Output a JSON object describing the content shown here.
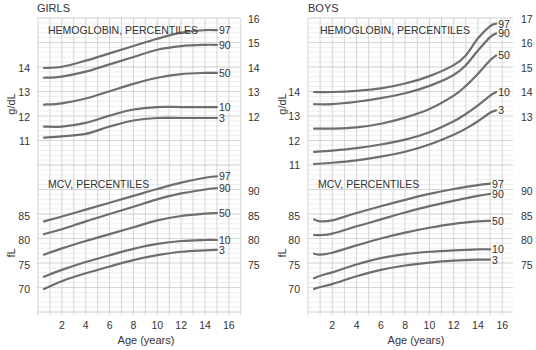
{
  "chart_data": [
    {
      "type": "line",
      "panel": "GIRLS",
      "title": "GIRLS",
      "xlabel": "Age (years)",
      "x_ticks": [
        2,
        4,
        6,
        8,
        10,
        12,
        14,
        16
      ],
      "xlim": [
        0,
        17
      ],
      "subcharts": [
        {
          "title": "HEMOGLOBIN, PERCENTILES",
          "ylabel": "g/dL",
          "left_ticks": [
            11,
            12,
            13,
            14
          ],
          "right_ticks": [
            12,
            13,
            14,
            15,
            16
          ],
          "x": [
            0.5,
            2,
            4,
            6,
            8,
            10,
            12,
            14,
            15
          ],
          "series": [
            {
              "name": "97",
              "values": [
                14.0,
                14.05,
                14.3,
                14.6,
                14.9,
                15.2,
                15.45,
                15.55,
                15.55
              ]
            },
            {
              "name": "90",
              "values": [
                13.6,
                13.65,
                13.85,
                14.15,
                14.45,
                14.75,
                14.9,
                14.95,
                14.95
              ]
            },
            {
              "name": "50",
              "values": [
                12.5,
                12.55,
                12.75,
                13.05,
                13.35,
                13.6,
                13.75,
                13.8,
                13.8
              ]
            },
            {
              "name": "10",
              "values": [
                11.6,
                11.6,
                11.75,
                12.05,
                12.3,
                12.4,
                12.4,
                12.4,
                12.4
              ]
            },
            {
              "name": "3",
              "values": [
                11.15,
                11.2,
                11.3,
                11.6,
                11.85,
                11.95,
                11.95,
                11.95,
                11.95
              ]
            }
          ]
        },
        {
          "title": "MCV, PERCENTILES",
          "ylabel": "fL",
          "left_ticks": [
            70,
            75,
            80,
            85
          ],
          "right_ticks": [
            75,
            80,
            85,
            90
          ],
          "x": [
            0.5,
            2,
            4,
            6,
            8,
            10,
            12,
            14,
            15
          ],
          "series": [
            {
              "name": "97",
              "values": [
                83.8,
                84.8,
                86.2,
                87.6,
                89.0,
                90.4,
                91.7,
                92.7,
                93.0
              ]
            },
            {
              "name": "90",
              "values": [
                81.2,
                82.2,
                83.8,
                85.3,
                86.8,
                88.3,
                89.5,
                90.3,
                90.6
              ]
            },
            {
              "name": "50",
              "values": [
                77.0,
                78.3,
                79.8,
                81.2,
                82.6,
                84.0,
                84.9,
                85.4,
                85.5
              ]
            },
            {
              "name": "10",
              "values": [
                72.5,
                73.9,
                75.5,
                76.9,
                78.2,
                79.2,
                79.8,
                80.0,
                80.0
              ]
            },
            {
              "name": "3",
              "values": [
                70.0,
                71.6,
                73.2,
                74.6,
                75.9,
                76.9,
                77.6,
                77.9,
                78.0
              ]
            }
          ]
        }
      ]
    },
    {
      "type": "line",
      "panel": "BOYS",
      "title": "BOYS",
      "xlabel": "Age (years)",
      "x_ticks": [
        2,
        4,
        6,
        8,
        10,
        12,
        14,
        16
      ],
      "xlim": [
        0,
        17
      ],
      "subcharts": [
        {
          "title": "HEMOGLOBIN, PERCENTILES",
          "ylabel": "g/dL",
          "left_ticks": [
            11,
            12,
            13,
            14
          ],
          "right_ticks": [
            13,
            14,
            15,
            16,
            17
          ],
          "x": [
            0.5,
            2,
            4,
            6,
            8,
            10,
            12,
            13,
            14,
            15,
            15.5
          ],
          "series": [
            {
              "name": "97",
              "values": [
                14.0,
                14.0,
                14.05,
                14.15,
                14.35,
                14.65,
                15.1,
                15.5,
                16.2,
                16.7,
                16.8
              ]
            },
            {
              "name": "90",
              "values": [
                13.5,
                13.5,
                13.6,
                13.75,
                13.95,
                14.25,
                14.7,
                15.1,
                15.7,
                16.25,
                16.4
              ]
            },
            {
              "name": "50",
              "values": [
                12.5,
                12.5,
                12.55,
                12.7,
                12.95,
                13.3,
                13.85,
                14.25,
                14.75,
                15.3,
                15.5
              ]
            },
            {
              "name": "10",
              "values": [
                11.55,
                11.6,
                11.7,
                11.85,
                12.05,
                12.35,
                12.8,
                13.1,
                13.45,
                13.85,
                14.0
              ]
            },
            {
              "name": "3",
              "values": [
                11.05,
                11.1,
                11.2,
                11.35,
                11.55,
                11.85,
                12.25,
                12.5,
                12.8,
                13.15,
                13.25
              ]
            }
          ]
        },
        {
          "title": "MCV, PERCENTILES",
          "ylabel": "fL",
          "left_ticks": [
            70,
            75,
            80,
            85
          ],
          "right_ticks": [
            75,
            80,
            85,
            90
          ],
          "x": [
            0.5,
            1,
            2,
            4,
            6,
            8,
            10,
            12,
            14,
            15
          ],
          "series": [
            {
              "name": "97",
              "values": [
                84.2,
                83.8,
                84.0,
                85.5,
                86.9,
                88.2,
                89.4,
                90.4,
                91.2,
                91.5
              ]
            },
            {
              "name": "90",
              "values": [
                81.0,
                81.0,
                81.3,
                82.8,
                84.2,
                85.6,
                86.9,
                88.0,
                89.0,
                89.4
              ]
            },
            {
              "name": "50",
              "values": [
                77.2,
                77.0,
                77.4,
                78.9,
                80.3,
                81.5,
                82.5,
                83.3,
                83.8,
                83.9
              ]
            },
            {
              "name": "10",
              "values": [
                72.2,
                72.7,
                73.4,
                75.0,
                76.3,
                77.1,
                77.6,
                77.9,
                78.1,
                78.1
              ]
            },
            {
              "name": "3",
              "values": [
                70.0,
                70.4,
                71.0,
                72.6,
                73.9,
                74.8,
                75.4,
                75.8,
                76.0,
                76.0
              ]
            }
          ]
        }
      ]
    }
  ],
  "panels": {
    "girls": {
      "title": "GIRLS",
      "hgb_title": "HEMOGLOBIN, PERCENTILES",
      "mcv_title": "MCV, PERCENTILES",
      "hgb_ylabel": "g/dL",
      "mcv_ylabel": "fL",
      "xlabel": "Age (years)"
    },
    "boys": {
      "title": "BOYS",
      "hgb_title": "HEMOGLOBIN, PERCENTILES",
      "mcv_title": "MCV, PERCENTILES",
      "hgb_ylabel": "g/dL",
      "mcv_ylabel": "fL",
      "xlabel": "Age (years)"
    }
  },
  "colors": {
    "curve": "#6e6e6e",
    "grid_major": "#d0d0d0",
    "grid_minor": "#e6e6e6",
    "text": "#333333"
  }
}
